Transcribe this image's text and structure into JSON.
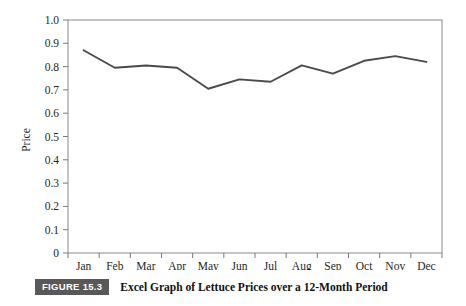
{
  "figure": {
    "badge_label": "FIGURE 15.3",
    "caption": "Excel Graph of Lettuce Prices over a 12-Month Period",
    "badge_color": "#585858",
    "caption_color": "#111111"
  },
  "chart_data": {
    "type": "line",
    "title": "",
    "xlabel": "",
    "ylabel": "Price",
    "categories": [
      "Jan",
      "Feb",
      "Mar",
      "Apr",
      "May",
      "Jun",
      "Jul",
      "Aug",
      "Sep",
      "Oct",
      "Nov",
      "Dec"
    ],
    "values": [
      0.87,
      0.795,
      0.805,
      0.795,
      0.705,
      0.745,
      0.735,
      0.805,
      0.77,
      0.825,
      0.845,
      0.82
    ],
    "series": [
      {
        "name": "Price",
        "values": [
          0.87,
          0.795,
          0.805,
          0.795,
          0.705,
          0.745,
          0.735,
          0.805,
          0.77,
          0.825,
          0.845,
          0.82
        ]
      }
    ],
    "ylim": [
      0,
      1.0
    ],
    "ytick_values": [
      0,
      0.1,
      0.2,
      0.3,
      0.4,
      0.5,
      0.6,
      0.7,
      0.8,
      0.9,
      1.0
    ],
    "ytick_labels": [
      "0",
      "0.1",
      "0.2",
      "0.3",
      "0.4",
      "0.5",
      "0.6",
      "0.7",
      "0.8",
      "0.9",
      "1.0"
    ],
    "grid": false,
    "legend": false,
    "legend_position": "none",
    "line_color": "#4a4a4a",
    "axis_color": "#7a7a7a",
    "plot_border": true,
    "markers": false
  }
}
